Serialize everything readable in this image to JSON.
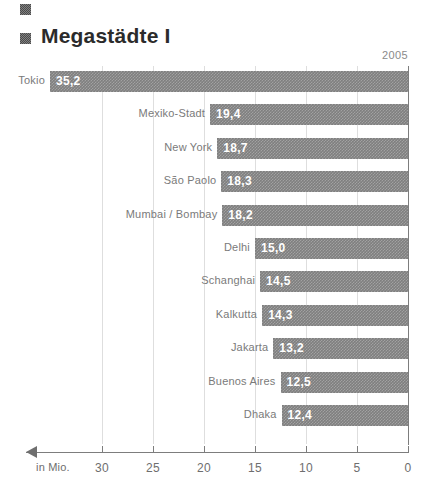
{
  "header": {
    "title": "Megastädte I",
    "bullet_top_icon": "square-bullet-icon",
    "bullet_title_icon": "square-bullet-icon"
  },
  "chart_data": {
    "type": "bar",
    "orientation": "horizontal-reversed",
    "title": "Megastädte I",
    "year_label": "2005",
    "xlabel": "in Mio.",
    "ylabel": "",
    "xlim": [
      0,
      35.2
    ],
    "axis_direction": "right-to-left",
    "grid": true,
    "legend": "none",
    "tick_values": [
      30,
      25,
      20,
      15,
      10,
      5,
      0
    ],
    "tick_labels": [
      "30",
      "25",
      "20",
      "15",
      "10",
      "5",
      "0"
    ],
    "categories": [
      "Tokio",
      "Mexiko-Stadt",
      "New York",
      "São Paolo",
      "Mumbai / Bombay",
      "Delhi",
      "Schanghai",
      "Kalkutta",
      "Jakarta",
      "Buenos Aires",
      "Dhaka"
    ],
    "values": [
      35.2,
      19.4,
      18.7,
      18.3,
      18.2,
      15.0,
      14.5,
      14.3,
      13.2,
      12.5,
      12.4
    ],
    "value_labels": [
      "35,2",
      "19,4",
      "18,7",
      "18,3",
      "18,2",
      "15,0",
      "14,5",
      "14,3",
      "13,2",
      "12,5",
      "12,4"
    ],
    "bar_color": "#7f7f7f",
    "value_text_color": "#ffffff",
    "label_text_color": "#7a7a7a",
    "axis_color": "#7d7d7d",
    "grid_color": "#dedede",
    "title_color": "#2b2b2b"
  }
}
